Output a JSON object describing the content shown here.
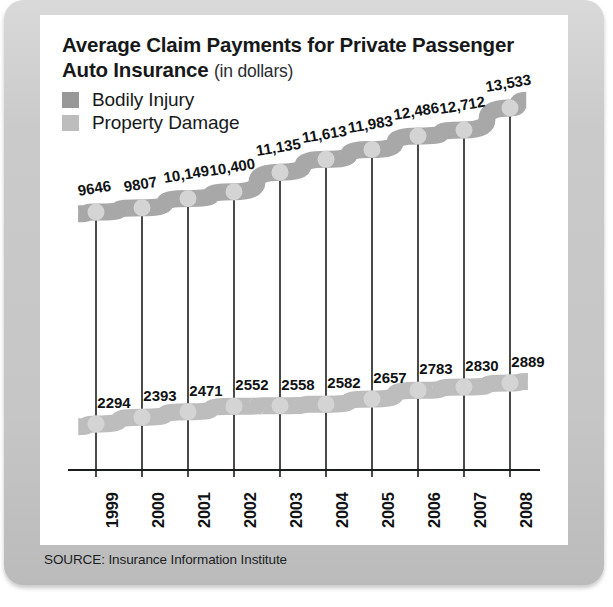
{
  "panel": {
    "title_main": "Average Claim Payments for Private Passenger Auto Insurance",
    "title_line1": "Average Claim Payments for Private Passenger",
    "title_line2": "Auto Insurance",
    "title_units": "(in dollars)",
    "source": "SOURCE: Insurance Information Institute"
  },
  "legend": {
    "items": [
      {
        "label": "Bodily Injury",
        "color": "#989898"
      },
      {
        "label": "Property Damage",
        "color": "#bdbdbd"
      }
    ]
  },
  "colors": {
    "panel_background": "#c9c9c9",
    "card_background": "#ffffff",
    "ribbon_bodily_injury": "#a8a8a8",
    "ribbon_property_damage": "#bdbdbd",
    "marker": "#d4d4d4",
    "axis": "#1a1c1e",
    "text": "#101214"
  },
  "chart_data": {
    "type": "line",
    "title": "Average Claim Payments for Private Passenger Auto Insurance (in dollars)",
    "xlabel": "",
    "ylabel": "",
    "categories": [
      "1999",
      "2000",
      "2001",
      "2002",
      "2003",
      "2004",
      "2005",
      "2006",
      "2007",
      "2008"
    ],
    "series": [
      {
        "name": "Bodily Injury",
        "color": "#a8a8a8",
        "values": [
          9646,
          9807,
          10149,
          10400,
          11135,
          11613,
          11983,
          12486,
          12712,
          13533
        ],
        "labels": [
          "9646",
          "9807",
          "10,149",
          "10,400",
          "11,135",
          "11,613",
          "11,983",
          "12,486",
          "12,712",
          "13,533"
        ]
      },
      {
        "name": "Property Damage",
        "color": "#bdbdbd",
        "values": [
          2294,
          2393,
          2471,
          2552,
          2558,
          2582,
          2657,
          2783,
          2830,
          2889
        ],
        "labels": [
          "2294",
          "2393",
          "2471",
          "2552",
          "2558",
          "2582",
          "2657",
          "2783",
          "2830",
          "2889"
        ]
      }
    ],
    "legend_position": "top-left",
    "grid": false,
    "ylim": [
      0,
      14000
    ],
    "annotations": "Vertical connector lines join each year's two series points."
  }
}
